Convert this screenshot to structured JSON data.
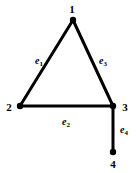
{
  "figure": {
    "type": "undirected-graph-diagram",
    "background_color": "#ffffff",
    "ink_color": "#000000",
    "width": 139,
    "height": 173
  },
  "nodes": [
    {
      "id": "1",
      "label": "1",
      "x": 73,
      "y": 20,
      "label_x": 72,
      "label_y": 9,
      "dot_radius": 3.2
    },
    {
      "id": "2",
      "label": "2",
      "x": 20,
      "y": 106,
      "label_x": 9,
      "label_y": 107,
      "dot_radius": 3.2
    },
    {
      "id": "3",
      "label": "3",
      "x": 113,
      "y": 106,
      "label_x": 125,
      "label_y": 107,
      "dot_radius": 3.2
    },
    {
      "id": "4",
      "label": "4",
      "x": 113,
      "y": 152,
      "label_x": 113,
      "label_y": 164,
      "dot_radius": 3.2
    }
  ],
  "edges": [
    {
      "id": "e1",
      "label": "e",
      "subscript": "1",
      "from": "1",
      "to": "2",
      "x1": 73,
      "y1": 20,
      "x2": 20,
      "y2": 106,
      "label_x": 39,
      "label_y": 61,
      "stroke_width": 3
    },
    {
      "id": "e2",
      "label": "e",
      "subscript": "2",
      "from": "2",
      "to": "3",
      "x1": 20,
      "y1": 106,
      "x2": 113,
      "y2": 106,
      "label_x": 66,
      "label_y": 122,
      "stroke_width": 3
    },
    {
      "id": "e3",
      "label": "e",
      "subscript": "3",
      "from": "1",
      "to": "3",
      "x1": 73,
      "y1": 20,
      "x2": 113,
      "y2": 106,
      "label_x": 103,
      "label_y": 61,
      "stroke_width": 3
    },
    {
      "id": "e4",
      "label": "e",
      "subscript": "4",
      "from": "3",
      "to": "4",
      "x1": 113,
      "y1": 106,
      "x2": 113,
      "y2": 152,
      "label_x": 124,
      "label_y": 130,
      "stroke_width": 3
    }
  ]
}
